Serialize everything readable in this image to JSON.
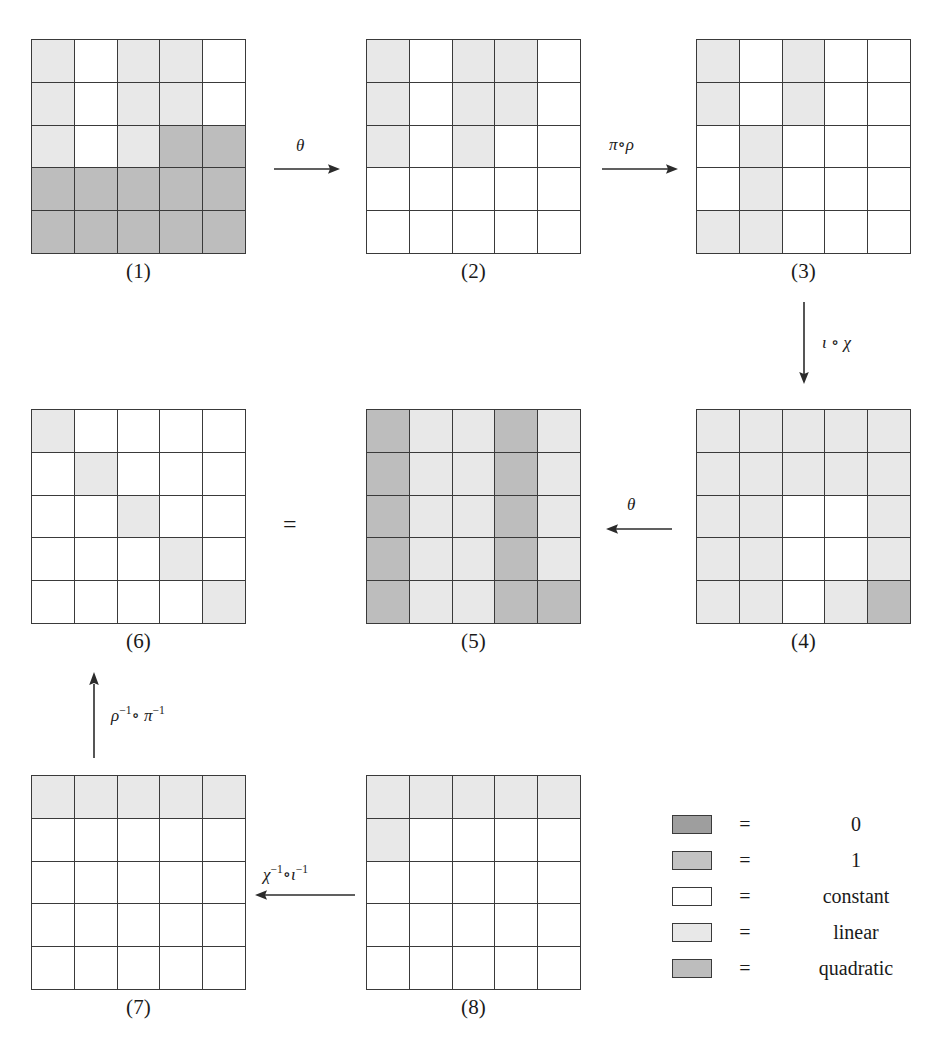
{
  "diagram": {
    "palette": {
      "zero": "#9e9e9e",
      "one": "#c3c3c3",
      "constant": "#ffffff",
      "linear": "#e8e8e8",
      "quadratic": "#bdbdbd",
      "line": "#3a3a3a"
    },
    "grid_size": 5,
    "matrices": [
      {
        "id": "m1",
        "label": "(1)",
        "cells": [
          [
            "linear",
            "constant",
            "linear",
            "linear",
            "constant"
          ],
          [
            "linear",
            "constant",
            "linear",
            "linear",
            "constant"
          ],
          [
            "linear",
            "constant",
            "linear",
            "quadratic",
            "quadratic"
          ],
          [
            "quadratic",
            "quadratic",
            "quadratic",
            "quadratic",
            "quadratic"
          ],
          [
            "quadratic",
            "quadratic",
            "quadratic",
            "quadratic",
            "quadratic"
          ]
        ]
      },
      {
        "id": "m2",
        "label": "(2)",
        "cells": [
          [
            "linear",
            "constant",
            "linear",
            "linear",
            "constant"
          ],
          [
            "linear",
            "constant",
            "linear",
            "linear",
            "constant"
          ],
          [
            "linear",
            "constant",
            "linear",
            "constant",
            "constant"
          ],
          [
            "constant",
            "constant",
            "constant",
            "constant",
            "constant"
          ],
          [
            "constant",
            "constant",
            "constant",
            "constant",
            "constant"
          ]
        ]
      },
      {
        "id": "m3",
        "label": "(3)",
        "cells": [
          [
            "linear",
            "constant",
            "linear",
            "constant",
            "constant"
          ],
          [
            "linear",
            "constant",
            "linear",
            "constant",
            "constant"
          ],
          [
            "constant",
            "linear",
            "constant",
            "constant",
            "constant"
          ],
          [
            "constant",
            "linear",
            "constant",
            "constant",
            "constant"
          ],
          [
            "linear",
            "linear",
            "constant",
            "constant",
            "constant"
          ]
        ]
      },
      {
        "id": "m4",
        "label": "(4)",
        "cells": [
          [
            "linear",
            "linear",
            "linear",
            "linear",
            "linear"
          ],
          [
            "linear",
            "linear",
            "linear",
            "linear",
            "linear"
          ],
          [
            "linear",
            "linear",
            "constant",
            "constant",
            "linear"
          ],
          [
            "linear",
            "linear",
            "constant",
            "constant",
            "linear"
          ],
          [
            "linear",
            "linear",
            "constant",
            "linear",
            "quadratic"
          ]
        ]
      },
      {
        "id": "m5",
        "label": "(5)",
        "cells": [
          [
            "quadratic",
            "linear",
            "linear",
            "quadratic",
            "linear"
          ],
          [
            "quadratic",
            "linear",
            "linear",
            "quadratic",
            "linear"
          ],
          [
            "quadratic",
            "linear",
            "linear",
            "quadratic",
            "linear"
          ],
          [
            "quadratic",
            "linear",
            "linear",
            "quadratic",
            "linear"
          ],
          [
            "quadratic",
            "linear",
            "linear",
            "quadratic",
            "quadratic"
          ]
        ]
      },
      {
        "id": "m6",
        "label": "(6)",
        "cells": [
          [
            "linear",
            "constant",
            "constant",
            "constant",
            "constant"
          ],
          [
            "constant",
            "linear",
            "constant",
            "constant",
            "constant"
          ],
          [
            "constant",
            "constant",
            "linear",
            "constant",
            "constant"
          ],
          [
            "constant",
            "constant",
            "constant",
            "linear",
            "constant"
          ],
          [
            "constant",
            "constant",
            "constant",
            "constant",
            "linear"
          ]
        ]
      },
      {
        "id": "m7",
        "label": "(7)",
        "cells": [
          [
            "linear",
            "linear",
            "linear",
            "linear",
            "linear"
          ],
          [
            "constant",
            "constant",
            "constant",
            "constant",
            "constant"
          ],
          [
            "constant",
            "constant",
            "constant",
            "constant",
            "constant"
          ],
          [
            "constant",
            "constant",
            "constant",
            "constant",
            "constant"
          ],
          [
            "constant",
            "constant",
            "constant",
            "constant",
            "constant"
          ]
        ]
      },
      {
        "id": "m8",
        "label": "(8)",
        "cells": [
          [
            "linear",
            "linear",
            "linear",
            "linear",
            "linear"
          ],
          [
            "linear",
            "constant",
            "constant",
            "constant",
            "constant"
          ],
          [
            "constant",
            "constant",
            "constant",
            "constant",
            "constant"
          ],
          [
            "constant",
            "constant",
            "constant",
            "constant",
            "constant"
          ],
          [
            "constant",
            "constant",
            "constant",
            "constant",
            "constant"
          ]
        ]
      }
    ],
    "arrows": {
      "theta_top": "θ",
      "pi_rho": "π∘ρ",
      "iota_chi": "ι ∘ χ",
      "theta_mid": "θ",
      "equals": "=",
      "rho_pi_inv_base": "ρ",
      "rho_pi_inv_mid": "∘ π",
      "chi_iota_inv_base": "χ",
      "chi_iota_inv_mid": "∘ι",
      "inverse_exponent": "−1"
    },
    "legend": {
      "equals": "=",
      "rows": [
        {
          "swatch": "zero",
          "label": "0"
        },
        {
          "swatch": "one",
          "label": "1"
        },
        {
          "swatch": "constant",
          "label": "constant"
        },
        {
          "swatch": "linear",
          "label": "linear"
        },
        {
          "swatch": "quadratic",
          "label": "quadratic"
        }
      ]
    }
  }
}
